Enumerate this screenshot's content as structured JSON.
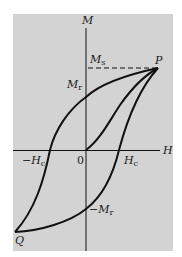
{
  "diagram": {
    "type": "magnetic-hysteresis-loop",
    "background_color": "#d3d3d3",
    "line_color": "#111111",
    "axes": {
      "x_label": "H",
      "y_label": "M",
      "origin_label": "0"
    },
    "labels": {
      "saturation": {
        "main": "M",
        "sub": "s"
      },
      "remanence_pos": {
        "main": "M",
        "sub": "r"
      },
      "remanence_neg": {
        "prefix": "−",
        "main": "M",
        "sub": "r"
      },
      "coercivity_pos": {
        "main": "H",
        "sub": "c"
      },
      "coercivity_neg": {
        "prefix": "−",
        "main": "H",
        "sub": "c"
      },
      "point_p": "P",
      "point_q": "Q"
    }
  }
}
